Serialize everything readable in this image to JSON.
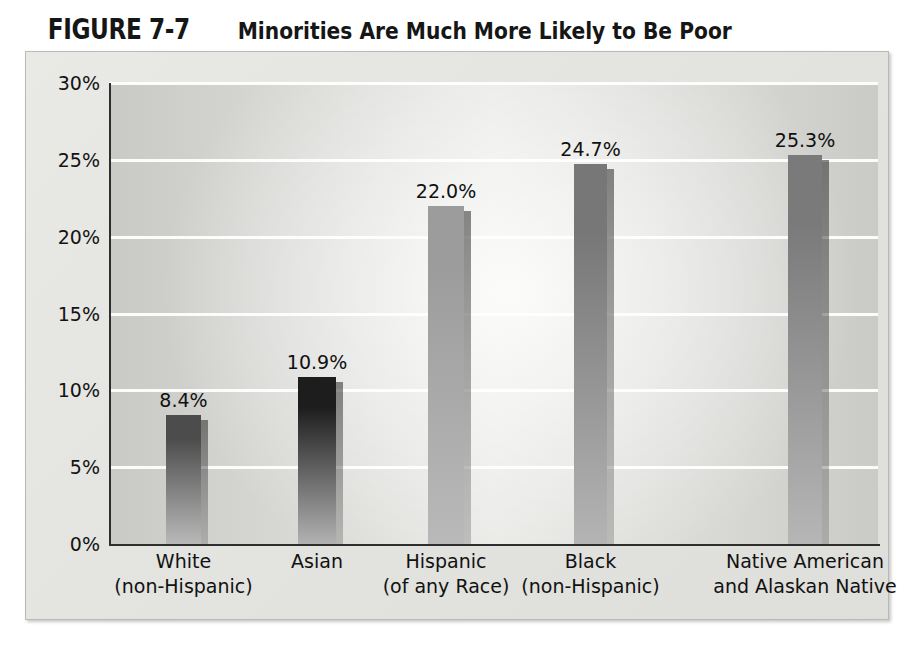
{
  "figure": {
    "number": "FIGURE 7-7",
    "title": "Minorities Are Much More Likely to Be Poor"
  },
  "chart_data": {
    "type": "bar",
    "title": "Minorities Are Much More Likely to Be Poor",
    "xlabel": "",
    "ylabel": "",
    "ylim": [
      0,
      30
    ],
    "yticks": [
      "0%",
      "5%",
      "10%",
      "15%",
      "20%",
      "25%",
      "30%"
    ],
    "ytick_values": [
      0,
      5,
      10,
      15,
      20,
      25,
      30
    ],
    "grid": true,
    "legend": "none",
    "categories": [
      "White (non-Hispanic)",
      "Asian",
      "Hispanic (of any Race)",
      "Black (non-Hispanic)",
      "Native American and Alaskan Native"
    ],
    "category_lines": [
      [
        "White",
        "(non-Hispanic)"
      ],
      [
        "Asian",
        ""
      ],
      [
        "Hispanic",
        "(of any Race)"
      ],
      [
        "Black",
        "(non-Hispanic)"
      ],
      [
        "Native American",
        "and Alaskan Native"
      ]
    ],
    "values": [
      8.4,
      10.9,
      22.0,
      24.7,
      25.3
    ],
    "value_labels": [
      "8.4%",
      "10.9%",
      "22.0%",
      "24.7%",
      "25.3%"
    ],
    "bar_colors_top": [
      "#4c4c4c",
      "#1d1d1d",
      "#9c9c9c",
      "#777777",
      "#7a7a7a"
    ],
    "bar_colors_bottom": [
      "#b9b9b9",
      "#b2b2b2",
      "#b9b9b9",
      "#b4b4b4",
      "#b6b6b6"
    ]
  },
  "style": {
    "panel_background": "#e5e5e2",
    "plot_background": "#d8d8d5",
    "gridline_color": "#ffffff",
    "axis_color": "#2e2e2e",
    "text_color": "#111111"
  }
}
